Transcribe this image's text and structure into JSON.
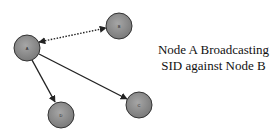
{
  "diagram": {
    "caption": {
      "line1": "Node A Broadcasting",
      "line2": "SID against Node B"
    },
    "nodes": [
      {
        "id": "A",
        "label": "A",
        "x": 27,
        "y": 48,
        "r": 13
      },
      {
        "id": "B",
        "label": "B",
        "x": 119,
        "y": 26,
        "r": 13
      },
      {
        "id": "C",
        "label": "C",
        "x": 139,
        "y": 105,
        "r": 13
      },
      {
        "id": "D",
        "label": "D",
        "x": 61,
        "y": 115,
        "r": 13
      }
    ],
    "edges": [
      {
        "from": "A",
        "to": "B",
        "style": "dotted",
        "direction": "both"
      },
      {
        "from": "A",
        "to": "C",
        "style": "solid",
        "direction": "forward"
      },
      {
        "from": "A",
        "to": "D",
        "style": "solid",
        "direction": "forward"
      }
    ],
    "colors": {
      "node_fill": "#8c8c8c",
      "node_stroke": "#333333",
      "edge": "#222222",
      "text": "#111111"
    }
  }
}
